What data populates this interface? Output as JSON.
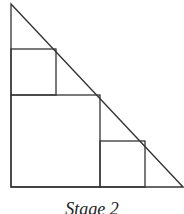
{
  "figure": {
    "caption": "Stage 2",
    "stroke_color": "#333333",
    "background": "#ffffff"
  },
  "diagram": {
    "triangle": {
      "points": [
        [
          11,
          4
        ],
        [
          11,
          187
        ],
        [
          184,
          187
        ]
      ]
    },
    "squares": [
      {
        "name": "large-square",
        "x": 11,
        "y": 95,
        "size": 92
      },
      {
        "name": "upper-small-square",
        "x": 11,
        "y": 49,
        "size": 46
      },
      {
        "name": "right-small-square",
        "x": 100,
        "y": 141,
        "size": 46
      }
    ]
  }
}
